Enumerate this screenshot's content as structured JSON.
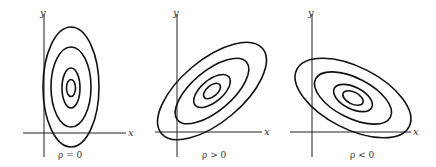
{
  "figure": {
    "panels": [
      {
        "id": "rho-zero",
        "x_label": "x",
        "y_label": "y",
        "caption": "ρ = 0",
        "orientation": "vertical axis-aligned ellipses",
        "contour_count": 4
      },
      {
        "id": "rho-positive",
        "x_label": "x",
        "y_label": "y",
        "caption": "ρ > 0",
        "orientation": "ellipses tilted upward (positive slope)",
        "contour_count": 4
      },
      {
        "id": "rho-negative",
        "x_label": "x",
        "y_label": "y",
        "caption": "ρ < 0",
        "orientation": "ellipses tilted downward (negative slope)",
        "contour_count": 4
      }
    ]
  },
  "colors": {
    "stroke": "#111111",
    "background": "#ffffff"
  }
}
